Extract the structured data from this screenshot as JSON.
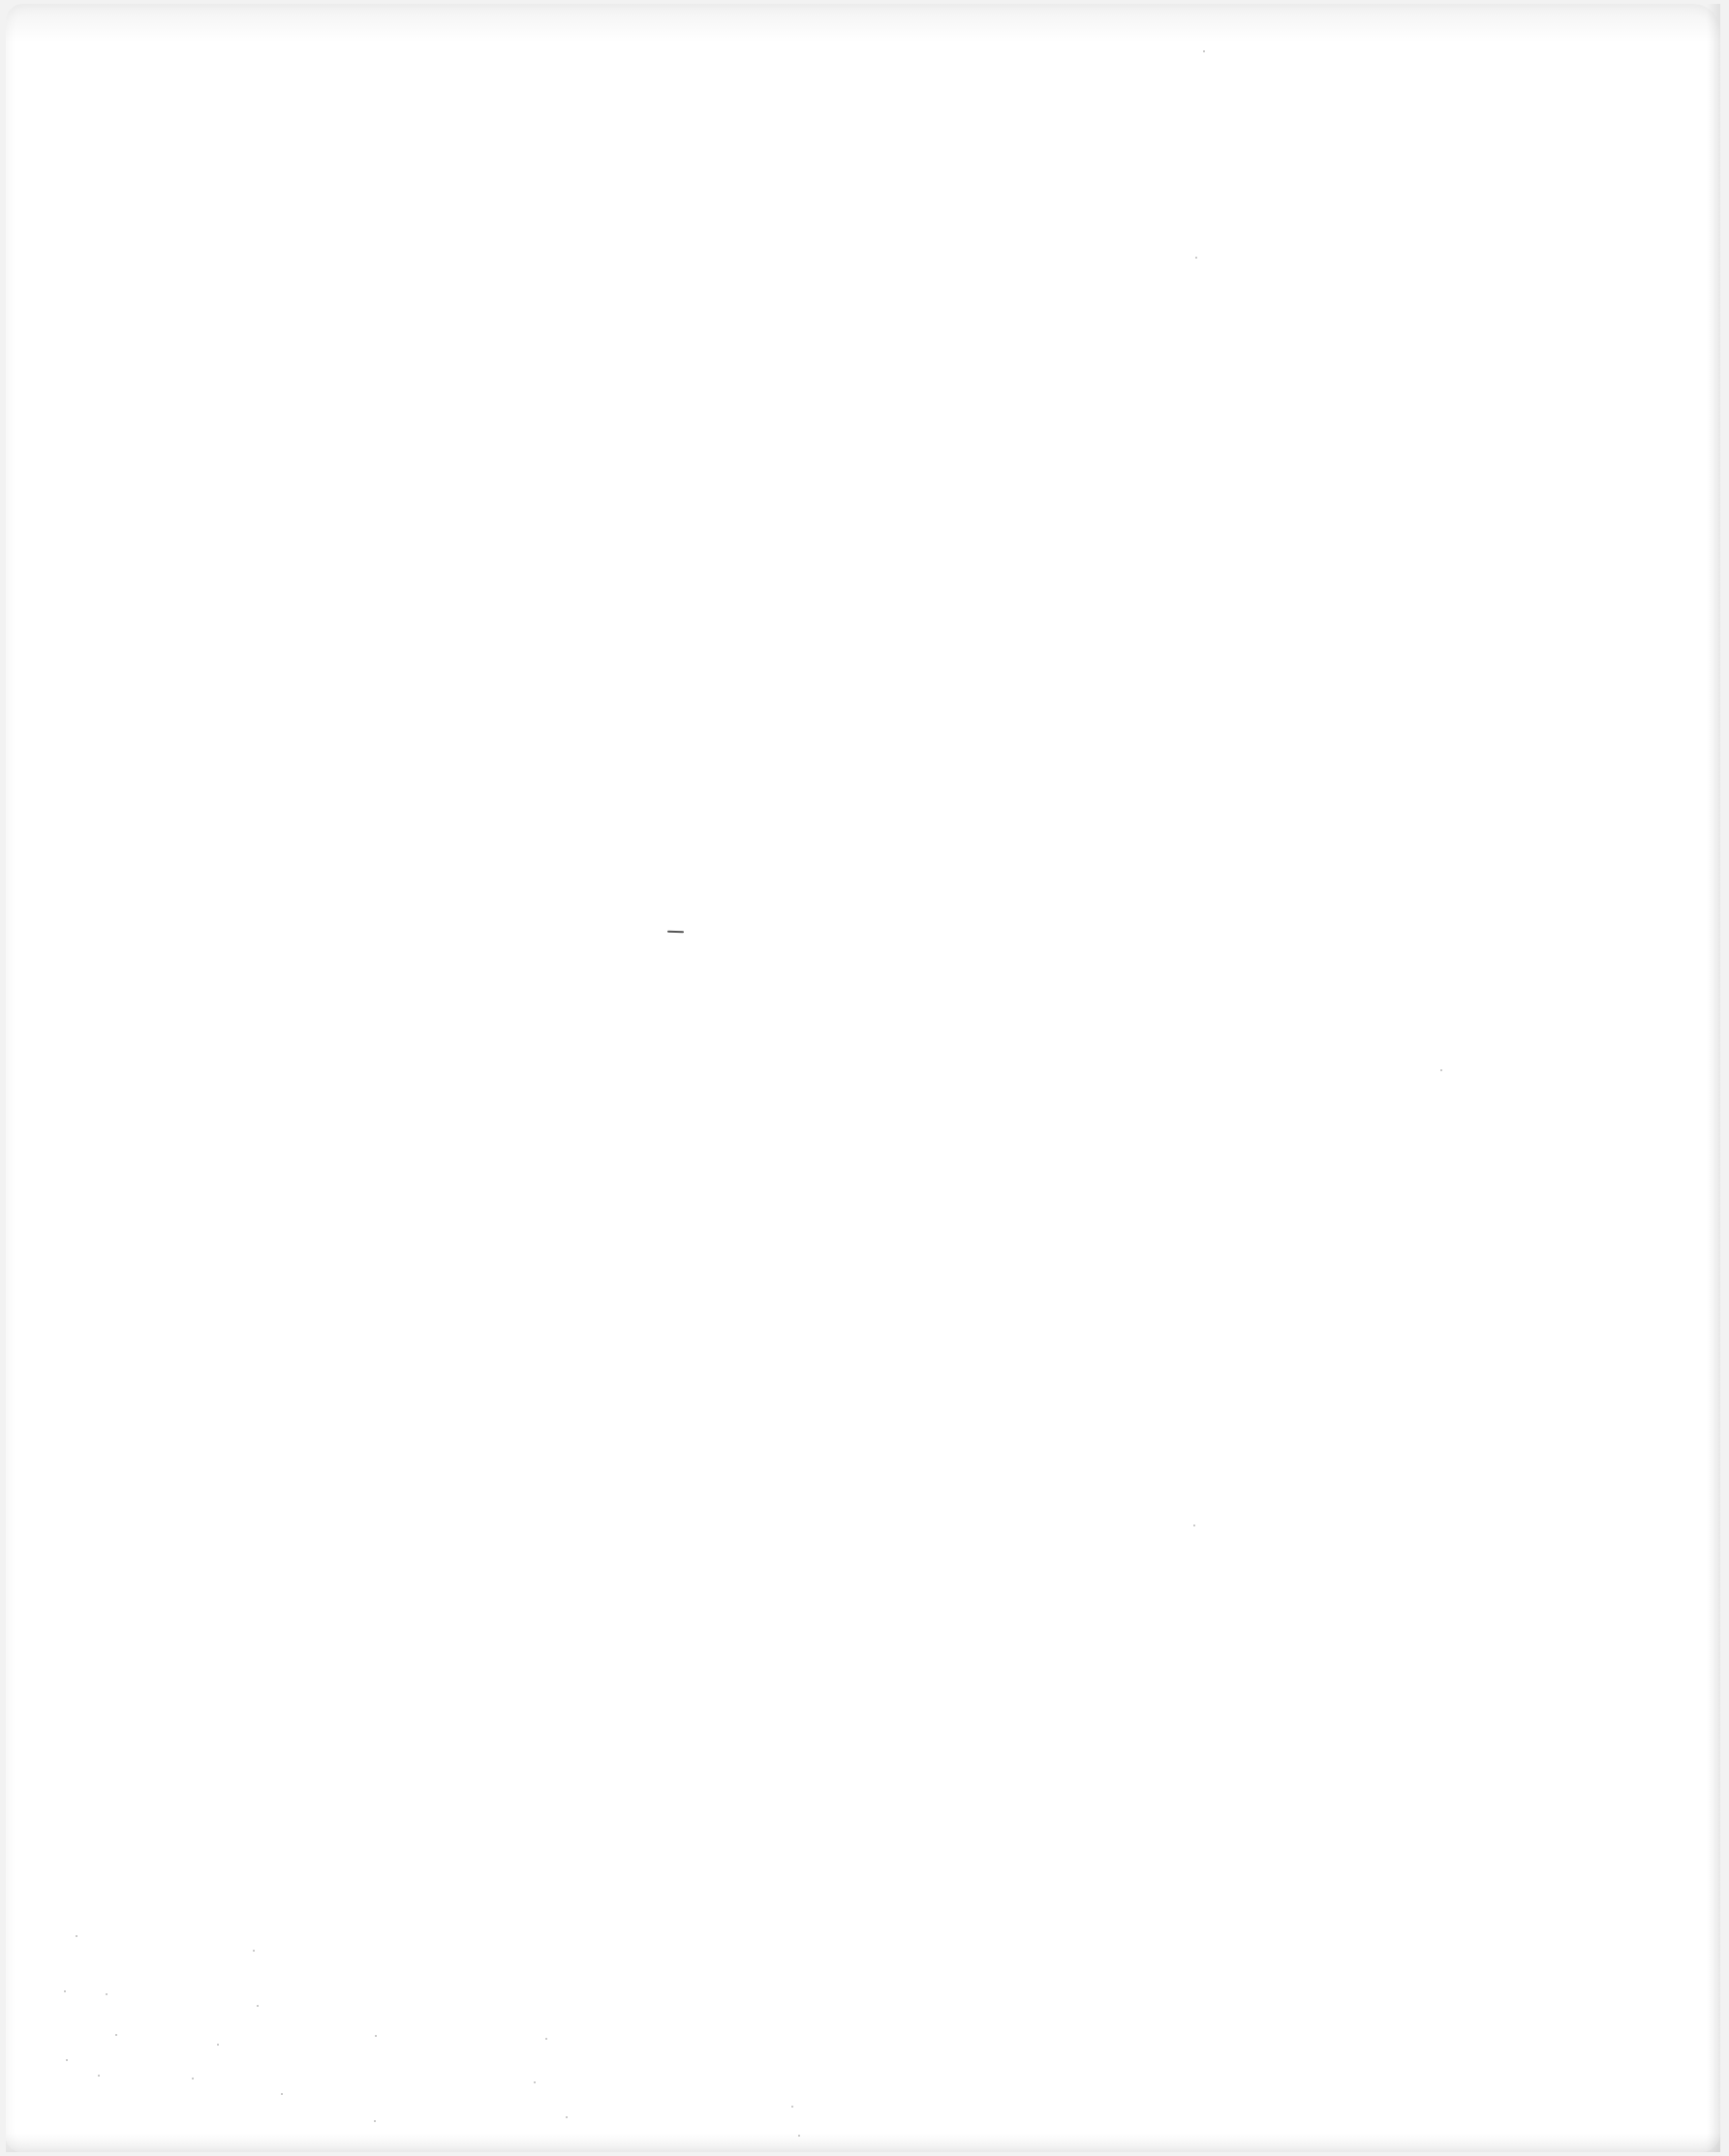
{
  "page": {
    "type": "blank-scanned-page",
    "background_color": "#ffffff",
    "text_content": ""
  },
  "marks": [
    {
      "name": "center-dash",
      "x": 689,
      "y": 961,
      "width": 17
    }
  ]
}
